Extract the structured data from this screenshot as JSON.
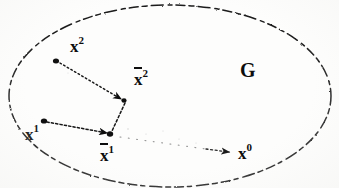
{
  "figure": {
    "type": "diagram",
    "caption_region_label": "G",
    "background_color": "#fdfdfc",
    "ink_color": "#0d0d0d",
    "width": 339,
    "height": 188,
    "region": {
      "name": "G",
      "label": "G",
      "label_x": 246,
      "label_y": 62,
      "shape": "ellipse",
      "stroke_style": "dashed",
      "cx": 170,
      "cy": 96,
      "rx": 162,
      "ry": 92
    },
    "points": [
      {
        "id": "x2",
        "base": "x",
        "superscript": "2",
        "overbar": false,
        "x": 56,
        "y": 60,
        "label_x": 70,
        "label_y": 44,
        "dot": true
      },
      {
        "id": "xbar2",
        "base": "x",
        "superscript": "2",
        "overbar": true,
        "x": 124,
        "y": 100,
        "label_x": 134,
        "label_y": 74,
        "dot": true
      },
      {
        "id": "x1",
        "base": "x",
        "superscript": "1",
        "overbar": false,
        "x": 44,
        "y": 121,
        "label_x": 26,
        "label_y": 127,
        "dot": true
      },
      {
        "id": "xbar1",
        "base": "x",
        "superscript": "1",
        "overbar": true,
        "x": 110,
        "y": 134,
        "label_x": 100,
        "label_y": 146,
        "dot": true
      },
      {
        "id": "x0",
        "base": "x",
        "superscript": "0",
        "overbar": false,
        "x": 233,
        "y": 152,
        "label_x": 239,
        "label_y": 143,
        "dot": false
      }
    ],
    "arrows": [
      {
        "id": "arrow-x2-to-xbar2",
        "from": "x2",
        "to": "xbar2",
        "style": "dotted",
        "arrowhead": true,
        "x1": 59,
        "y1": 62,
        "x2": 122,
        "y2": 99
      },
      {
        "id": "arrow-x1-to-xbar1",
        "from": "x1",
        "to": "xbar1",
        "style": "dotted",
        "arrowhead": true,
        "x1": 47,
        "y1": 122,
        "x2": 108,
        "y2": 133
      },
      {
        "id": "arrow-xbar1-to-x0",
        "from": "xbar1",
        "to": "x0",
        "style": "faint-dotted",
        "arrowhead": true,
        "x1": 118,
        "y1": 137,
        "x2": 230,
        "y2": 152
      }
    ],
    "segments": [
      {
        "id": "segment-xbar2-to-xbar1",
        "from": "xbar2",
        "to": "xbar1",
        "style": "dotted",
        "x1": 124,
        "y1": 102,
        "x2": 111,
        "y2": 132
      }
    ]
  }
}
